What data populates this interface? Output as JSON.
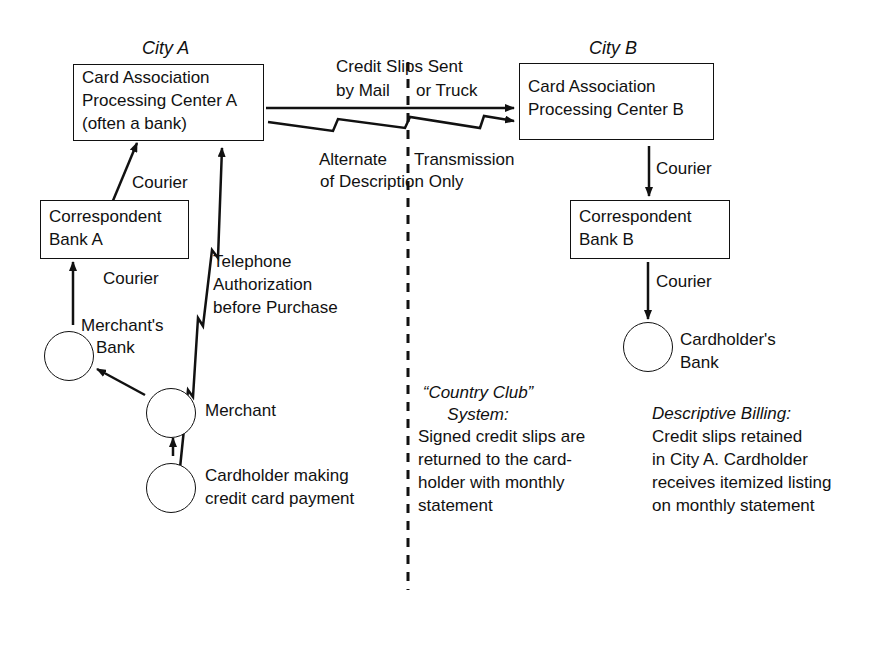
{
  "cities": {
    "a": "City A",
    "b": "City B"
  },
  "nodes": {
    "center_a": "Card Association\nProcessing Center A\n(often a bank)",
    "center_b": "Card Association\nProcessing Center B",
    "corr_bank_a": "Correspondent\nBank A",
    "corr_bank_b": "Correspondent\nBank B",
    "merchants_bank_l1": "Merchant's",
    "merchants_bank_l2": "Bank",
    "merchant": "Merchant",
    "cardholder_l1": "Cardholder making",
    "cardholder_l2": "credit card payment",
    "cardholders_bank_l1": "Cardholder's",
    "cardholders_bank_l2": "Bank"
  },
  "edges": {
    "slips_l1": "Credit Slips Sent",
    "slips_l2a": "by Mail",
    "slips_l2b": "or Truck",
    "alt_l1a": "Alternate",
    "alt_l1b": "Transmission",
    "alt_l2": "of Description Only",
    "courier_a_top": "Courier",
    "courier_a_bottom": "Courier",
    "courier_b_top": "Courier",
    "courier_b_bottom": "Courier",
    "telephone_l1": "Telephone",
    "telephone_l2": "Authorization",
    "telephone_l3": "before Purchase"
  },
  "notes": {
    "country_club_title_l1": "“Country Club”",
    "country_club_title_l2": "System:",
    "country_club_body": [
      "Signed credit slips are",
      "returned to the card-",
      "holder with monthly",
      "statement"
    ],
    "descriptive_title": "Descriptive Billing:",
    "descriptive_body": [
      "Credit slips retained",
      "in City A. Cardholder",
      "receives itemized listing",
      "on monthly statement"
    ]
  }
}
